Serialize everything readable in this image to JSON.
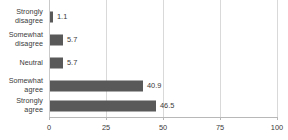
{
  "chart_data": {
    "type": "bar",
    "orientation": "horizontal",
    "title": "",
    "subtitle": "",
    "xlabel": "",
    "ylabel": "",
    "categories": [
      "Strongly disagree",
      "Somewhat disagree",
      "Neutral",
      "Somewhat agree",
      "Strongly agree"
    ],
    "values": [
      1.1,
      5.7,
      5.7,
      40.9,
      46.5
    ],
    "data_labels": [
      "1.1",
      "5.7",
      "5.7",
      "40.9",
      "46.5"
    ],
    "xlim": [
      0,
      100
    ],
    "xticks": [
      0,
      25,
      50,
      75,
      100
    ],
    "xtick_labels": [
      "0",
      "25",
      "50",
      "75",
      "100"
    ],
    "grid": true,
    "grid_axis": "x",
    "legend": false,
    "legend_position": "none",
    "bar_color": "#595959",
    "gridline_color": "#d9d9d9",
    "axis_color": "#b8b8b8",
    "text_color": "#3a3a3a"
  }
}
